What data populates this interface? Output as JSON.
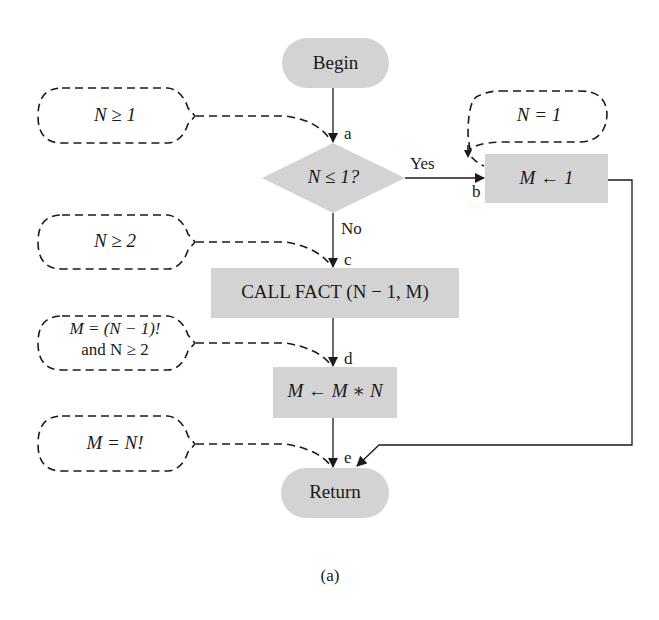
{
  "diagram": {
    "type": "flowchart",
    "caption": "(a)",
    "colors": {
      "node_fill": "#d3d3d3",
      "line": "#1a1a1a",
      "background": "#ffffff"
    },
    "nodes": {
      "begin": {
        "label": "Begin",
        "shape": "terminal"
      },
      "decision": {
        "label": "N ≤ 1?",
        "shape": "diamond"
      },
      "assign_one": {
        "label": "M ← 1",
        "shape": "process"
      },
      "call_fact": {
        "label": "CALL FACT (N − 1, M)",
        "shape": "process"
      },
      "multiply": {
        "label": "M ← M ∗ N",
        "shape": "process"
      },
      "return": {
        "label": "Return",
        "shape": "terminal"
      }
    },
    "edge_labels": {
      "yes": "Yes",
      "no": "No"
    },
    "points": {
      "a": "a",
      "b": "b",
      "c": "c",
      "d": "d",
      "e": "e"
    },
    "assertions": [
      {
        "point": "a",
        "text": "N ≥ 1"
      },
      {
        "point": "b",
        "text": "N = 1"
      },
      {
        "point": "c",
        "text": "N ≥ 2"
      },
      {
        "point": "d",
        "text_line1": "M = (N − 1)!",
        "text_line2": "and N ≥ 2"
      },
      {
        "point": "e",
        "text": "M = N!"
      }
    ]
  }
}
